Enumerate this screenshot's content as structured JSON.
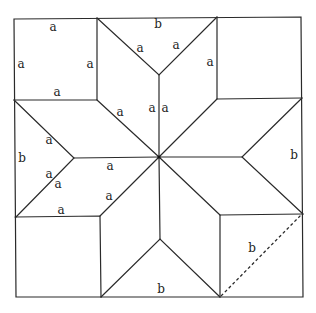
{
  "diagram": {
    "label_a": "a",
    "label_b": "b",
    "outer_square": {
      "x1": 14,
      "y1": 18,
      "x2": 303,
      "y2": 297
    },
    "center": {
      "x": 159,
      "y": 157
    },
    "labels": [
      {
        "text": "a",
        "x": 53,
        "y": 27,
        "note": "top-left square top edge"
      },
      {
        "text": "a",
        "x": 21,
        "y": 64,
        "note": "top-left square left edge"
      },
      {
        "text": "a",
        "x": 90,
        "y": 64,
        "note": "top-left square right edge"
      },
      {
        "text": "a",
        "x": 57,
        "y": 92,
        "note": "top-left square bottom edge"
      },
      {
        "text": "b",
        "x": 158,
        "y": 24,
        "note": "top triangle base"
      },
      {
        "text": "a",
        "x": 140,
        "y": 48,
        "note": "top triangle left side"
      },
      {
        "text": "a",
        "x": 176,
        "y": 45,
        "note": "top triangle right side"
      },
      {
        "text": "a",
        "x": 210,
        "y": 62,
        "note": "top-right rhombus edge"
      },
      {
        "text": "a",
        "x": 152,
        "y": 108,
        "note": "vertical rhombus edge left"
      },
      {
        "text": "a",
        "x": 165,
        "y": 108,
        "note": "vertical rhombus edge right"
      },
      {
        "text": "a",
        "x": 120,
        "y": 112,
        "note": "upper-left rhombus edge"
      },
      {
        "text": "a",
        "x": 165,
        "y": 108,
        "note": ""
      },
      {
        "text": "a",
        "x": 49,
        "y": 140,
        "note": "left triangle upper side"
      },
      {
        "text": "b",
        "x": 22,
        "y": 158,
        "note": "left triangle base"
      },
      {
        "text": "a",
        "x": 110,
        "y": 166,
        "note": "horizontal rhombus edge"
      },
      {
        "text": "a",
        "x": 49,
        "y": 174,
        "note": "left triangle lower side"
      },
      {
        "text": "a",
        "x": 58,
        "y": 184,
        "note": "lower-left rhombus edge"
      },
      {
        "text": "a",
        "x": 109,
        "y": 196,
        "note": "lower-left rhombus inner edge"
      },
      {
        "text": "a",
        "x": 61,
        "y": 210,
        "note": "bottom-left square top edge"
      },
      {
        "text": "b",
        "x": 294,
        "y": 155,
        "note": "right triangle base"
      },
      {
        "text": "b",
        "x": 252,
        "y": 248,
        "note": "bottom-right square diagonal"
      },
      {
        "text": "b",
        "x": 161,
        "y": 289,
        "note": "bottom triangle base"
      }
    ],
    "dashed_line": {
      "x1": 220,
      "y1": 296,
      "x2": 302,
      "y2": 214
    }
  }
}
